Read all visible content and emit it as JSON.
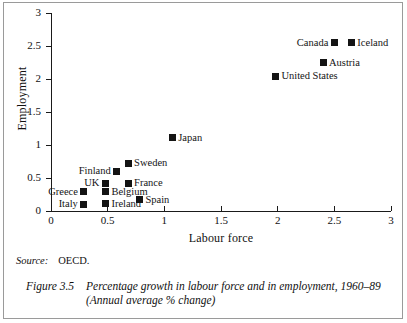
{
  "chart_data": {
    "type": "scatter",
    "title": "",
    "xlabel": "Labour force",
    "ylabel": "Employment",
    "xlim": [
      0,
      3
    ],
    "ylim": [
      0,
      3
    ],
    "xticks": [
      "0",
      "0.5",
      "1",
      "1.5",
      "2",
      "2.5",
      "3"
    ],
    "xtick_values": [
      0,
      0.5,
      1,
      1.5,
      2,
      2.5,
      3
    ],
    "yticks": [
      "0",
      "0.5",
      "1",
      "1.5",
      "2",
      "2.5",
      "3"
    ],
    "ytick_values": [
      0,
      0.5,
      1,
      1.5,
      2,
      2.5,
      3
    ],
    "grid": false,
    "legend": "none",
    "marker": "filled-square",
    "marker_color": "#141414",
    "points": [
      {
        "label": "Canada",
        "x": 2.5,
        "y": 2.55,
        "label_side": "left"
      },
      {
        "label": "Iceland",
        "x": 2.65,
        "y": 2.55,
        "label_side": "right"
      },
      {
        "label": "Austria",
        "x": 2.4,
        "y": 2.25,
        "label_side": "right"
      },
      {
        "label": "United States",
        "x": 1.98,
        "y": 2.04,
        "label_side": "right"
      },
      {
        "label": "Japan",
        "x": 1.07,
        "y": 1.11,
        "label_side": "right"
      },
      {
        "label": "Sweden",
        "x": 0.68,
        "y": 0.72,
        "label_side": "right"
      },
      {
        "label": "Finland",
        "x": 0.58,
        "y": 0.6,
        "label_side": "left"
      },
      {
        "label": "France",
        "x": 0.68,
        "y": 0.42,
        "label_side": "right"
      },
      {
        "label": "UK",
        "x": 0.48,
        "y": 0.42,
        "label_side": "left"
      },
      {
        "label": "Greece",
        "x": 0.29,
        "y": 0.29,
        "label_side": "left"
      },
      {
        "label": "Belgium",
        "x": 0.48,
        "y": 0.29,
        "label_side": "right"
      },
      {
        "label": "Spain",
        "x": 0.78,
        "y": 0.17,
        "label_side": "right"
      },
      {
        "label": "Italy",
        "x": 0.29,
        "y": 0.1,
        "label_side": "left"
      },
      {
        "label": "Ireland",
        "x": 0.48,
        "y": 0.11,
        "label_side": "right"
      }
    ]
  },
  "source": {
    "key": "Source:",
    "value": "OECD."
  },
  "caption": {
    "number": "Figure 3.5",
    "text": "Percentage growth in labour force and in employment, 1960–89 (Annual average % change)"
  }
}
